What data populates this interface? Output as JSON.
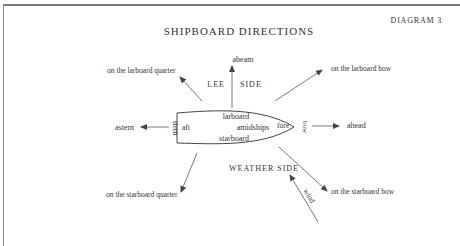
{
  "diagram": {
    "label": "DIAGRAM 3",
    "title": "SHIPBOARD DIRECTIONS",
    "ship": {
      "parts": {
        "stern": "stern",
        "aft": "aft",
        "larboard": "larboard",
        "amidships": "amidships",
        "starboard": "starboard",
        "fore": "fore",
        "bow": "bow"
      }
    },
    "sides": {
      "lee_left": "LEE",
      "lee_right": "SIDE",
      "weather": "WEATHER SIDE"
    },
    "directions": {
      "abeam": "abeam",
      "ahead": "ahead",
      "astern": "astern",
      "larboard_quarter": "on the larboard quarter",
      "larboard_bow": "on the larboard bow",
      "starboard_quarter": "on the starboard quarter",
      "starboard_bow": "on the starboard bow"
    },
    "wind": "wind",
    "colors": {
      "ink": "#333333",
      "line": "#555555",
      "frame": "#777777"
    }
  }
}
